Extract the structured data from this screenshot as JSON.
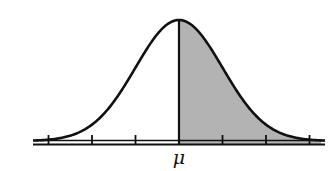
{
  "diagram": {
    "type": "normal-distribution-curve",
    "mean_label": "μ",
    "shaded_region": "right-of-mean",
    "shaded_fraction": 0.5,
    "tick_count": 7,
    "tick_positions_sigma": [
      -3,
      -2,
      -1,
      0,
      1,
      2,
      3
    ],
    "colors": {
      "curve": "#111111",
      "axis": "#111111",
      "shade": "#b3b3b3",
      "background": "#ffffff"
    }
  }
}
